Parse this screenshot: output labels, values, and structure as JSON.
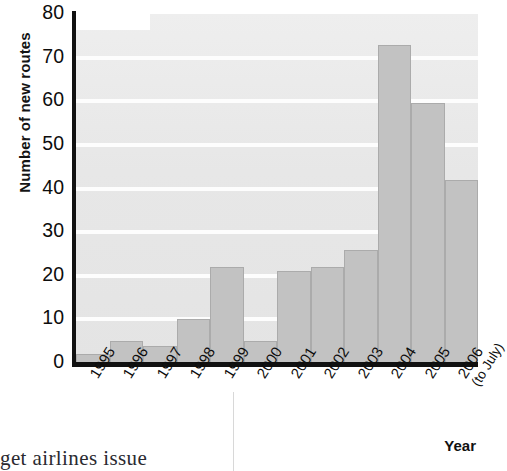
{
  "chart_data": {
    "type": "bar",
    "title": "",
    "xlabel": "Year",
    "ylabel": "Number of new routes",
    "categories": [
      "1995",
      "1996",
      "1997",
      "1998",
      "1999",
      "2000",
      "2001",
      "2002",
      "2003",
      "2004",
      "2005",
      "2006"
    ],
    "category_sublabels": [
      "",
      "",
      "",
      "",
      "",
      "",
      "",
      "",
      "",
      "",
      "",
      "(to July)"
    ],
    "values": [
      2,
      5,
      4,
      10,
      22,
      5,
      21,
      22,
      26,
      73,
      59.5,
      42
    ],
    "ylim": [
      0,
      80
    ],
    "yticks": [
      0,
      10,
      20,
      30,
      40,
      50,
      60,
      70,
      80
    ],
    "ytick_labels": [
      "0",
      "10",
      "20",
      "30",
      "40",
      "50",
      "60",
      "70",
      "80"
    ],
    "grid": true,
    "grid_color": "#fdfdfd",
    "legend": "none",
    "bar_color": "#c2c2c2",
    "bar_edge_color": "#ababab",
    "plot_background": "#e9e9e9",
    "axis_color": "#111111"
  },
  "page": {
    "text_fragment": "get  airlines  issue"
  }
}
